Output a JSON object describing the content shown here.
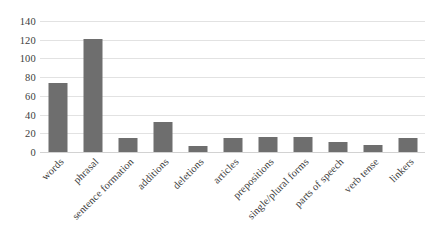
{
  "chart_data": {
    "type": "bar",
    "title": "",
    "xlabel": "",
    "ylabel": "",
    "ylim": [
      0,
      140
    ],
    "ytick_step": 20,
    "yticks": [
      140,
      120,
      100,
      80,
      60,
      40,
      20,
      0
    ],
    "grid": true,
    "legend": false,
    "bar_color": "#6e6e6e",
    "gridline_color": "#e2e2e2",
    "categories": [
      "words",
      "phrasal",
      "sentence formation",
      "additions",
      "deletions",
      "articles",
      "prepositions",
      "single/plural forms",
      "parts of speech",
      "verb tense",
      "linkers"
    ],
    "values": [
      74,
      121,
      15,
      32,
      6,
      15,
      16,
      16,
      11,
      7,
      15
    ]
  }
}
